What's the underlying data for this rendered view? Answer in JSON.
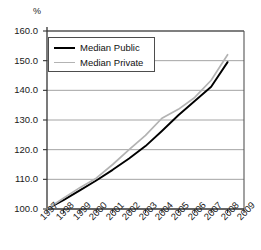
{
  "chart_data": {
    "type": "line",
    "title": "",
    "subtitle": "",
    "unit_label": "%",
    "xlabel": "",
    "ylabel": "",
    "x": [
      1997,
      1998,
      1999,
      2000,
      2001,
      2002,
      2003,
      2004,
      2005,
      2006,
      2007,
      2008
    ],
    "xtick_labels": [
      "1997",
      "1998",
      "1999",
      "2000",
      "2001",
      "2002",
      "2003",
      "2004",
      "2005",
      "2006",
      "2007",
      "2008",
      "2009"
    ],
    "xlim": [
      1997,
      2009
    ],
    "ytick_labels": [
      "160.0",
      "150.0",
      "140.0",
      "130.0",
      "120.0",
      "110.0",
      "100.0"
    ],
    "yticks": [
      160.0,
      150.0,
      140.0,
      130.0,
      120.0,
      110.0,
      100.0
    ],
    "ylim": [
      100.0,
      160.0
    ],
    "grid": true,
    "legend_position": "upper-left",
    "series": [
      {
        "name": "Median Public",
        "color": "#000000",
        "values": [
          100.0,
          103.0,
          106.3,
          109.6,
          113.2,
          117.0,
          121.2,
          126.3,
          131.6,
          136.4,
          141.2,
          149.5
        ]
      },
      {
        "name": "Median Private",
        "color": "#b3b3b3",
        "values": [
          100.0,
          103.6,
          107.2,
          110.4,
          115.0,
          120.0,
          124.8,
          130.6,
          133.6,
          137.6,
          143.4,
          152.0
        ]
      }
    ]
  },
  "legend": {
    "entries": [
      {
        "label": "Median Public"
      },
      {
        "label": "Median Private"
      }
    ]
  }
}
